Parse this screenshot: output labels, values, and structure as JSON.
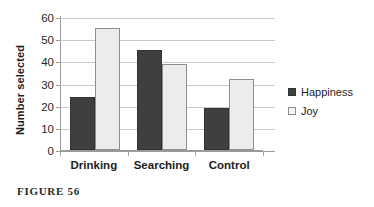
{
  "caption": "FIGURE 56",
  "legend": {
    "position": "right",
    "entries": [
      {
        "label": "Happiness",
        "swatch": "happiness-swatch",
        "color": "#3f3f3f"
      },
      {
        "label": "Joy",
        "swatch": "joy-swatch",
        "color": "#ececec"
      }
    ]
  },
  "chart_data": {
    "type": "bar",
    "title": "",
    "subtitle": "",
    "xlabel": "",
    "ylabel": "Number selected",
    "categories": [
      "Drinking",
      "Searching",
      "Control"
    ],
    "series": [
      {
        "name": "Happiness",
        "color": "#3f3f3f",
        "values": [
          24,
          45,
          19
        ]
      },
      {
        "name": "Joy",
        "color": "#ececec",
        "values": [
          55,
          39,
          32
        ]
      }
    ],
    "ylim": [
      0,
      60
    ],
    "ytick_step": 10,
    "yticks": [
      0,
      10,
      20,
      30,
      40,
      50,
      60
    ],
    "ytick_labels": [
      "0",
      "10",
      "20",
      "30",
      "40",
      "50",
      "60"
    ],
    "grid": {
      "horizontal": true,
      "vertical": false
    },
    "legend_position": "right",
    "annotations": []
  }
}
